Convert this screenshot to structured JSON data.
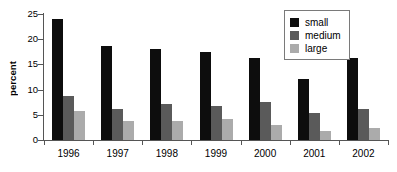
{
  "chart_data": {
    "type": "bar",
    "title": "",
    "subtitle": "",
    "xlabel": "",
    "ylabel": "percent",
    "categories": [
      "1996",
      "1997",
      "1998",
      "1999",
      "2000",
      "2001",
      "2002"
    ],
    "series": [
      {
        "name": "small",
        "color": "#0d0d0d",
        "values": [
          24.1,
          18.7,
          18.1,
          17.4,
          16.3,
          12.1,
          16.3
        ]
      },
      {
        "name": "medium",
        "color": "#5a5a5a",
        "values": [
          8.7,
          6.2,
          7.1,
          6.7,
          7.5,
          5.4,
          6.1
        ]
      },
      {
        "name": "large",
        "color": "#ababab",
        "values": [
          5.8,
          3.7,
          3.8,
          4.1,
          2.9,
          1.8,
          2.3
        ]
      }
    ],
    "ylim": [
      0,
      25
    ],
    "ytick_values": [
      0,
      5,
      10,
      15,
      20,
      25
    ],
    "ytick_labels": [
      "0",
      "5",
      "10",
      "15",
      "20",
      "25"
    ],
    "grid": false,
    "legend_position": "top-right",
    "legend_entries": [
      "small",
      "medium",
      "large"
    ],
    "annotations": []
  }
}
